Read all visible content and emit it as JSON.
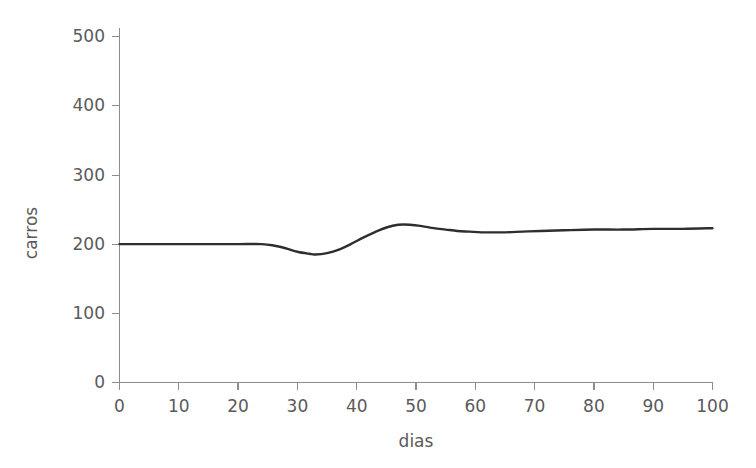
{
  "chart_data": {
    "type": "line",
    "title": "",
    "subtitle": "",
    "xlabel": "dias",
    "ylabel": "carros",
    "xlim": [
      0,
      100
    ],
    "ylim": [
      0,
      500
    ],
    "xticks": [
      0,
      10,
      20,
      30,
      40,
      50,
      60,
      70,
      80,
      90,
      100
    ],
    "xtick_labels": [
      "0",
      "10",
      "20",
      "30",
      "40",
      "50",
      "60",
      "70",
      "80",
      "90",
      "100"
    ],
    "yticks": [
      0,
      100,
      200,
      300,
      400,
      500
    ],
    "ytick_labels": [
      "0",
      "100",
      "200",
      "300",
      "400",
      "500"
    ],
    "grid": false,
    "legend": null,
    "line_color": "#2e2e2e",
    "axis_color": "#8d8d8d",
    "background_color": "#ffffff",
    "series": [
      {
        "name": "carros",
        "x": [
          0,
          5,
          10,
          15,
          20,
          24,
          26,
          28,
          30,
          32,
          33,
          35,
          37,
          39,
          41,
          43,
          45,
          47,
          49,
          51,
          53,
          55,
          57,
          59,
          61,
          63,
          65,
          68,
          71,
          75,
          80,
          85,
          90,
          95,
          100
        ],
        "values": [
          200,
          200,
          200,
          200,
          200,
          200,
          198,
          194,
          189,
          186,
          185,
          187,
          192,
          200,
          209,
          217,
          224,
          228,
          228,
          226,
          223,
          221,
          219,
          218,
          217,
          217,
          217,
          218,
          219,
          220,
          221,
          221,
          222,
          222,
          223
        ]
      }
    ],
    "annotations": []
  },
  "axes": {
    "x_label": "dias",
    "y_label": "carros"
  }
}
